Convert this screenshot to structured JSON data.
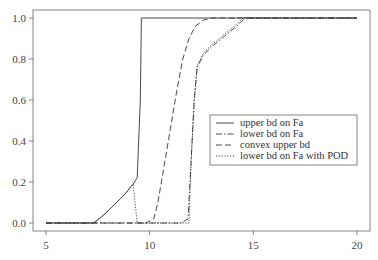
{
  "chart_data": {
    "type": "line",
    "title": "",
    "xlabel": "",
    "ylabel": "",
    "xlim": [
      4.4,
      20.6
    ],
    "ylim": [
      -0.04,
      1.04
    ],
    "xticks": [
      5,
      10,
      15,
      20
    ],
    "xtick_labels": [
      "5",
      "10",
      "15",
      "20"
    ],
    "yticks": [
      0.0,
      0.2,
      0.4,
      0.6,
      0.8,
      1.0
    ],
    "ytick_labels": [
      "0.0",
      "0.2",
      "0.4",
      "0.6",
      "0.8",
      "1.0"
    ],
    "grid": false,
    "legend_position": "center-right",
    "series": [
      {
        "name": "upper bd on Fa",
        "style": "solid",
        "x": [
          5.0,
          7.3,
          7.8,
          8.3,
          8.8,
          9.2,
          9.4,
          9.55,
          9.6,
          20.0
        ],
        "y": [
          0.0,
          0.0,
          0.04,
          0.09,
          0.14,
          0.19,
          0.22,
          0.6,
          1.0,
          1.0
        ]
      },
      {
        "name": "lower bd on Fa",
        "style": "dashdot",
        "x": [
          5.0,
          11.5,
          11.85,
          12.0,
          12.15,
          12.3,
          12.6,
          13.0,
          13.6,
          14.2,
          14.6,
          20.0
        ],
        "y": [
          0.0,
          0.0,
          0.02,
          0.3,
          0.6,
          0.76,
          0.82,
          0.86,
          0.91,
          0.96,
          1.0,
          1.0
        ]
      },
      {
        "name": "convex upper bd",
        "style": "dashed",
        "x": [
          5.0,
          9.8,
          10.2,
          10.4,
          10.7,
          11.0,
          11.3,
          11.6,
          11.9,
          12.2,
          12.6,
          13.0,
          20.0
        ],
        "y": [
          0.0,
          0.0,
          0.02,
          0.1,
          0.28,
          0.46,
          0.64,
          0.8,
          0.9,
          0.96,
          0.99,
          1.0,
          1.0
        ]
      },
      {
        "name": "lower bd on Fa with POD",
        "style": "dotted",
        "x": [
          5.0,
          7.3,
          7.8,
          8.3,
          8.8,
          9.2,
          9.4,
          11.9,
          12.0,
          12.15,
          12.3,
          12.6,
          13.0,
          13.6,
          14.2,
          14.5,
          20.0
        ],
        "y": [
          0.0,
          0.0,
          0.04,
          0.09,
          0.14,
          0.19,
          0.0,
          0.0,
          0.3,
          0.6,
          0.77,
          0.83,
          0.87,
          0.92,
          0.97,
          1.0,
          1.0
        ]
      }
    ]
  },
  "legend": {
    "items": [
      {
        "label": "upper bd on Fa",
        "style": "solid"
      },
      {
        "label": "lower bd on Fa",
        "style": "dashdot"
      },
      {
        "label": "convex upper bd",
        "style": "dashed"
      },
      {
        "label": "lower bd on Fa with POD",
        "style": "dotted"
      }
    ]
  },
  "colors": {
    "line": "#333333",
    "axis": "#555555",
    "background": "#ffffff"
  }
}
